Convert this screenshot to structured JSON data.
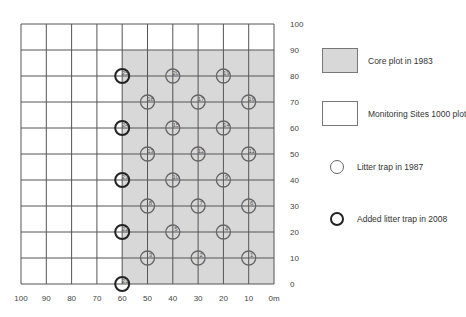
{
  "grid": {
    "x_ticks": [
      "100",
      "90",
      "80",
      "70",
      "60",
      "50",
      "40",
      "30",
      "20",
      "10",
      "0m"
    ],
    "y_ticks": [
      "100",
      "90",
      "80",
      "70",
      "60",
      "50",
      "40",
      "30",
      "20",
      "10",
      "0"
    ],
    "core_plot_x_range_m": [
      0,
      60
    ],
    "core_plot_y_range_m": [
      0,
      90
    ],
    "colors": {
      "core_fill": "#d8d8d8",
      "grid_line": "#555555",
      "trap_1987": "#666666",
      "trap_2008": "#222222"
    }
  },
  "traps_1987": [
    {
      "id": "1",
      "x": 10,
      "y": 10
    },
    {
      "id": "2",
      "x": 30,
      "y": 10
    },
    {
      "id": "3",
      "x": 50,
      "y": 10
    },
    {
      "id": "4",
      "x": 20,
      "y": 20
    },
    {
      "id": "5",
      "x": 40,
      "y": 20
    },
    {
      "id": "6",
      "x": 10,
      "y": 30
    },
    {
      "id": "7",
      "x": 30,
      "y": 30
    },
    {
      "id": "8",
      "x": 50,
      "y": 30
    },
    {
      "id": "9",
      "x": 20,
      "y": 40
    },
    {
      "id": "10",
      "x": 40,
      "y": 40
    },
    {
      "id": "11",
      "x": 10,
      "y": 50
    },
    {
      "id": "12",
      "x": 30,
      "y": 50
    },
    {
      "id": "13",
      "x": 50,
      "y": 50
    },
    {
      "id": "14",
      "x": 20,
      "y": 60
    },
    {
      "id": "15",
      "x": 40,
      "y": 60
    },
    {
      "id": "16",
      "x": 10,
      "y": 70
    },
    {
      "id": "17",
      "x": 30,
      "y": 70
    },
    {
      "id": "18",
      "x": 50,
      "y": 70
    },
    {
      "id": "19",
      "x": 20,
      "y": 80
    },
    {
      "id": "20",
      "x": 40,
      "y": 80
    }
  ],
  "traps_2008": [
    {
      "id": "21",
      "x": 60,
      "y": 0
    },
    {
      "id": "22",
      "x": 60,
      "y": 20
    },
    {
      "id": "23",
      "x": 60,
      "y": 40
    },
    {
      "id": "24",
      "x": 60,
      "y": 60
    },
    {
      "id": "25",
      "x": 60,
      "y": 80
    }
  ],
  "legend": {
    "core_plot": "Core plot in 1983",
    "monitoring_plot": "Monitoring Sites 1000 plot",
    "trap_1987": "Litter trap in 1987",
    "trap_2008": "Added litter trap in 2008"
  }
}
